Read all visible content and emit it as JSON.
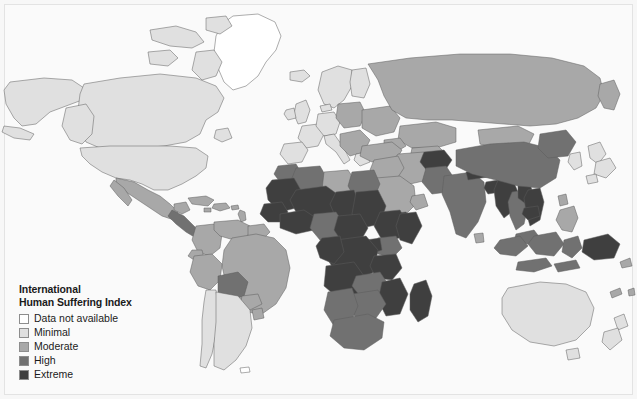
{
  "figure": {
    "type": "choropleth-world-map",
    "background_color": "#f7f7f7",
    "frame_color": "#e3e3e3",
    "ocean_color": "#fafafa",
    "border_color": "#5c5c5c"
  },
  "legend": {
    "title_line1": "International",
    "title_line2": "Human Suffering Index",
    "items": [
      {
        "label": "Data not available",
        "color": "#ffffff"
      },
      {
        "label": "Minimal",
        "color": "#e0e0e0"
      },
      {
        "label": "Moderate",
        "color": "#a8a8a8"
      },
      {
        "label": "High",
        "color": "#717171"
      },
      {
        "label": "Extreme",
        "color": "#3f3f3f"
      }
    ]
  },
  "chart_data": {
    "type": "map",
    "title": "International Human Suffering Index",
    "projection": "equirectangular",
    "legend_position": "bottom-left",
    "grid": false,
    "classes": [
      {
        "name": "Data not available",
        "color": "#ffffff"
      },
      {
        "name": "Minimal",
        "color": "#e0e0e0"
      },
      {
        "name": "Moderate",
        "color": "#a8a8a8"
      },
      {
        "name": "High",
        "color": "#717171"
      },
      {
        "name": "Extreme",
        "color": "#3f3f3f"
      }
    ],
    "regions": [
      {
        "name": "Greenland",
        "class": "Data not available"
      },
      {
        "name": "Antarctica",
        "class": "Data not available"
      },
      {
        "name": "Iceland",
        "class": "Minimal"
      },
      {
        "name": "Canada",
        "class": "Minimal"
      },
      {
        "name": "United States",
        "class": "Minimal"
      },
      {
        "name": "Alaska",
        "class": "Minimal"
      },
      {
        "name": "Mexico",
        "class": "Moderate"
      },
      {
        "name": "Central America",
        "class": "High"
      },
      {
        "name": "Caribbean",
        "class": "Moderate"
      },
      {
        "name": "Brazil",
        "class": "Moderate"
      },
      {
        "name": "Colombia",
        "class": "Moderate"
      },
      {
        "name": "Venezuela",
        "class": "Moderate"
      },
      {
        "name": "Peru",
        "class": "Moderate"
      },
      {
        "name": "Bolivia",
        "class": "High"
      },
      {
        "name": "Chile",
        "class": "Minimal"
      },
      {
        "name": "Argentina",
        "class": "Minimal"
      },
      {
        "name": "Western Europe",
        "class": "Minimal"
      },
      {
        "name": "Scandinavia",
        "class": "Minimal"
      },
      {
        "name": "Eastern Europe",
        "class": "Moderate"
      },
      {
        "name": "Russia",
        "class": "Moderate"
      },
      {
        "name": "Turkey",
        "class": "Moderate"
      },
      {
        "name": "Middle East",
        "class": "Moderate"
      },
      {
        "name": "Saudi Arabia",
        "class": "Moderate"
      },
      {
        "name": "Yemen",
        "class": "Extreme"
      },
      {
        "name": "North Africa",
        "class": "High"
      },
      {
        "name": "Libya",
        "class": "Moderate"
      },
      {
        "name": "Egypt",
        "class": "High"
      },
      {
        "name": "Sudan",
        "class": "Extreme"
      },
      {
        "name": "Ethiopia",
        "class": "Extreme"
      },
      {
        "name": "Somalia",
        "class": "Extreme"
      },
      {
        "name": "West Africa",
        "class": "Extreme"
      },
      {
        "name": "Nigeria",
        "class": "High"
      },
      {
        "name": "Central Africa",
        "class": "Extreme"
      },
      {
        "name": "DR Congo",
        "class": "Extreme"
      },
      {
        "name": "Angola",
        "class": "Extreme"
      },
      {
        "name": "Kenya",
        "class": "High"
      },
      {
        "name": "Tanzania",
        "class": "Extreme"
      },
      {
        "name": "Mozambique",
        "class": "Extreme"
      },
      {
        "name": "Zambia",
        "class": "High"
      },
      {
        "name": "South Africa",
        "class": "High"
      },
      {
        "name": "Namibia",
        "class": "High"
      },
      {
        "name": "Madagascar",
        "class": "Extreme"
      },
      {
        "name": "Afghanistan",
        "class": "Extreme"
      },
      {
        "name": "Pakistan",
        "class": "High"
      },
      {
        "name": "India",
        "class": "High"
      },
      {
        "name": "Nepal",
        "class": "Extreme"
      },
      {
        "name": "Bangladesh",
        "class": "Extreme"
      },
      {
        "name": "Myanmar",
        "class": "Extreme"
      },
      {
        "name": "Laos",
        "class": "Extreme"
      },
      {
        "name": "Vietnam",
        "class": "Extreme"
      },
      {
        "name": "Thailand",
        "class": "High"
      },
      {
        "name": "Cambodia",
        "class": "Extreme"
      },
      {
        "name": "China",
        "class": "High"
      },
      {
        "name": "Mongolia",
        "class": "Moderate"
      },
      {
        "name": "Japan",
        "class": "Minimal"
      },
      {
        "name": "South Korea",
        "class": "Minimal"
      },
      {
        "name": "Philippines",
        "class": "Moderate"
      },
      {
        "name": "Indonesia",
        "class": "High"
      },
      {
        "name": "Papua New Guinea",
        "class": "Extreme"
      },
      {
        "name": "Australia",
        "class": "Minimal"
      },
      {
        "name": "New Zealand",
        "class": "Minimal"
      }
    ]
  }
}
